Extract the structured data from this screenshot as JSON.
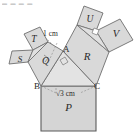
{
  "figure": {
    "title_artifact": "▬ ▬ ▬ ▬",
    "colors": {
      "square_fill": "#d7d7d7",
      "square_fill_light": "#dcdcdc",
      "stroke": "#6e6e6e",
      "stroke_dark": "#555555",
      "text": "#2b2b2b",
      "background": "#ffffff",
      "dashed": "#8a8a8a"
    },
    "squares": [
      {
        "name": "square-P",
        "label": "P",
        "cx": 68.5,
        "cy": 108,
        "note": "square on base BC, bottom"
      },
      {
        "name": "square-Q",
        "label": "Q",
        "cx": 45.5,
        "cy": 60.5,
        "note": "square on side AB"
      },
      {
        "name": "square-R",
        "label": "R",
        "cx": 86.5,
        "cy": 56.5,
        "note": "square on side AC"
      },
      {
        "name": "square-S",
        "label": "S",
        "cx": 19.5,
        "cy": 63.5,
        "note": "square on leg of Q"
      },
      {
        "name": "square-T",
        "label": "T",
        "cx": 30.5,
        "cy": 40.5,
        "note": "square on leg of Q"
      },
      {
        "name": "square-U",
        "label": "U",
        "cx": 90.5,
        "cy": 20.0,
        "note": "square on leg of R"
      },
      {
        "name": "square-V",
        "label": "V",
        "cx": 118.0,
        "cy": 32.5,
        "note": "square on leg of R"
      }
    ],
    "points": [
      {
        "name": "point-A",
        "label": "A",
        "x": 63,
        "y": 51
      },
      {
        "name": "point-B",
        "label": "B",
        "x": 38,
        "y": 86
      },
      {
        "name": "point-C",
        "label": "C",
        "x": 94,
        "y": 86
      }
    ],
    "dimensions": [
      {
        "name": "length-1cm",
        "label": "1 cm",
        "x": 44,
        "y": 35,
        "applies_to": "segment A-Q"
      },
      {
        "name": "length-sqrt3cm",
        "label": "√3 cm",
        "x": 55,
        "y": 95,
        "applies_to": "segment B-C"
      }
    ],
    "right_angle_marks": [
      {
        "name": "right-angle-at-A",
        "near": "A"
      },
      {
        "name": "right-angle-in-Q",
        "near": "Q"
      },
      {
        "name": "right-angle-at-U-V",
        "near": "U"
      }
    ]
  }
}
